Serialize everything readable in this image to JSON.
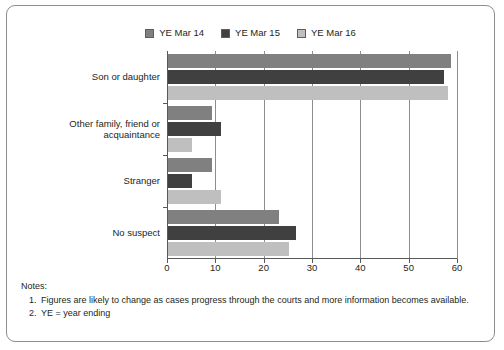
{
  "figure": {
    "border_color": "#8d8d8d",
    "background": "#ffffff"
  },
  "legend": {
    "position": "top-center",
    "items": [
      {
        "label": "YE Mar 14",
        "color": "#808080",
        "swatch_name": "legend-swatch-ye-mar-14"
      },
      {
        "label": "YE Mar 15",
        "color": "#404040",
        "swatch_name": "legend-swatch-ye-mar-15"
      },
      {
        "label": "YE Mar 16",
        "color": "#bfbfbf",
        "swatch_name": "legend-swatch-ye-mar-16"
      }
    ]
  },
  "axis": {
    "x_ticks": [
      "0",
      "10",
      "20",
      "30",
      "40",
      "50",
      "60"
    ],
    "x_min": 0,
    "x_max": 60,
    "x_step": 10
  },
  "notes": {
    "title": "Notes:",
    "items": [
      {
        "num": "1.",
        "text": "Figures are likely to change as cases progress through the courts and more information becomes available."
      },
      {
        "num": "2.",
        "text": "YE = year ending"
      }
    ]
  },
  "chart_data": {
    "type": "bar",
    "orientation": "horizontal",
    "title": "",
    "xlabel": "",
    "ylabel": "",
    "xlim": [
      0,
      60
    ],
    "grid": true,
    "legend_position": "top-center",
    "categories": [
      "Son or daughter",
      "Other family, friend or acquaintance",
      "Stranger",
      "No suspect"
    ],
    "series": [
      {
        "name": "YE Mar 14",
        "color": "#808080",
        "values": [
          58.5,
          9.0,
          9.0,
          23.0
        ]
      },
      {
        "name": "YE Mar 15",
        "color": "#404040",
        "values": [
          57.0,
          11.0,
          5.0,
          26.5
        ]
      },
      {
        "name": "YE Mar 16",
        "color": "#bfbfbf",
        "values": [
          58.0,
          5.0,
          11.0,
          25.0
        ]
      }
    ]
  }
}
